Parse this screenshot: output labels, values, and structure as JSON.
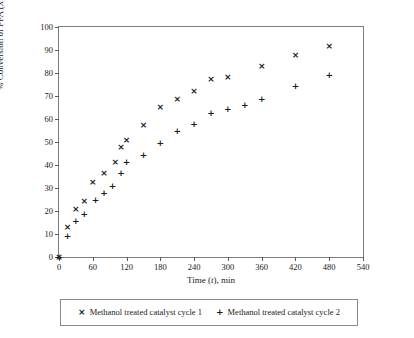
{
  "chart_data": {
    "type": "scatter",
    "title": "",
    "xlabel": "Time (t), min",
    "ylabel": "% Conversion of FFA (XF)",
    "ylabel_parts": {
      "prefix": "% Conversion of FFA (",
      "italic": "X",
      "subscript": "F",
      "suffix": ")"
    },
    "xlabel_parts": {
      "prefix": "Time (",
      "italic": "t",
      "suffix": "), min"
    },
    "xlim": [
      0,
      540
    ],
    "ylim": [
      0,
      100
    ],
    "xticks": [
      0,
      60,
      120,
      180,
      240,
      300,
      360,
      420,
      480,
      540
    ],
    "yticks": [
      0,
      10,
      20,
      30,
      40,
      50,
      60,
      70,
      80,
      90,
      100
    ],
    "grid": false,
    "legend_position": "below-plot",
    "series": [
      {
        "name": "Methanol treated catalyst cycle 1",
        "marker": "cross",
        "symbol": "×",
        "color": "#1a1a1a",
        "points": [
          {
            "x": 0,
            "y": 0
          },
          {
            "x": 15,
            "y": 13.0
          },
          {
            "x": 30,
            "y": 20.5
          },
          {
            "x": 45,
            "y": 24.0
          },
          {
            "x": 60,
            "y": 32.5
          },
          {
            "x": 80,
            "y": 36.5
          },
          {
            "x": 100,
            "y": 41.0
          },
          {
            "x": 110,
            "y": 47.5
          },
          {
            "x": 120,
            "y": 50.5
          },
          {
            "x": 150,
            "y": 57.0
          },
          {
            "x": 180,
            "y": 65.0
          },
          {
            "x": 210,
            "y": 68.5
          },
          {
            "x": 240,
            "y": 72.0
          },
          {
            "x": 270,
            "y": 77.0
          },
          {
            "x": 300,
            "y": 78.0
          },
          {
            "x": 360,
            "y": 83.0
          },
          {
            "x": 420,
            "y": 87.5
          },
          {
            "x": 480,
            "y": 91.5
          }
        ]
      },
      {
        "name": "Methanol treated catalyst cycle 2",
        "marker": "plus",
        "symbol": "+",
        "color": "#1a1a1a",
        "points": [
          {
            "x": 0,
            "y": 0
          },
          {
            "x": 15,
            "y": 9.0
          },
          {
            "x": 30,
            "y": 15.5
          },
          {
            "x": 45,
            "y": 18.5
          },
          {
            "x": 65,
            "y": 24.5
          },
          {
            "x": 80,
            "y": 27.5
          },
          {
            "x": 95,
            "y": 30.5
          },
          {
            "x": 110,
            "y": 36.5
          },
          {
            "x": 120,
            "y": 41.0
          },
          {
            "x": 150,
            "y": 44.0
          },
          {
            "x": 180,
            "y": 49.5
          },
          {
            "x": 210,
            "y": 54.5
          },
          {
            "x": 240,
            "y": 57.5
          },
          {
            "x": 270,
            "y": 62.5
          },
          {
            "x": 300,
            "y": 64.0
          },
          {
            "x": 330,
            "y": 66.0
          },
          {
            "x": 360,
            "y": 68.5
          },
          {
            "x": 420,
            "y": 74.0
          },
          {
            "x": 480,
            "y": 79.0
          }
        ]
      }
    ]
  },
  "legend": {
    "entries": [
      {
        "symbol": "×",
        "label": "Methanol treated catalyst cycle 1"
      },
      {
        "symbol": "+",
        "label": "Methanol treated catalyst cycle 2"
      }
    ]
  }
}
